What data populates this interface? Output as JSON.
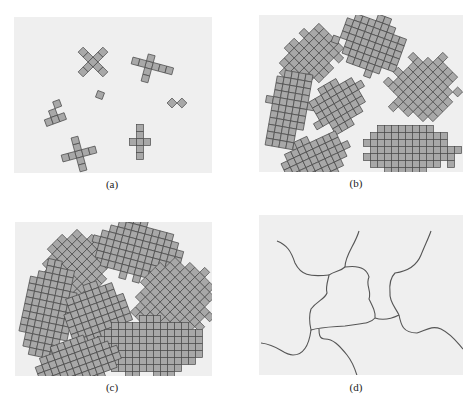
{
  "figure": {
    "colors": {
      "panel_bg": "#efefef",
      "cell_fill": "#a8a8a8",
      "cell_stroke": "#4a4a4a",
      "boundary": "#555555"
    },
    "cell_size": 7,
    "panels": [
      {
        "id": "a",
        "caption": "(a)",
        "description": "Small crystallite nuclei",
        "grains": [
          {
            "cx": 79,
            "cy": 45,
            "angle": 45,
            "cells": [
              [
                0,
                0
              ],
              [
                1,
                0
              ],
              [
                2,
                0
              ],
              [
                -1,
                0
              ],
              [
                -2,
                0
              ],
              [
                0,
                1
              ],
              [
                0,
                2
              ],
              [
                0,
                -1
              ],
              [
                0,
                -2
              ]
            ]
          },
          {
            "cx": 135,
            "cy": 48,
            "angle": 15,
            "cells": [
              [
                0,
                0
              ],
              [
                -1,
                0
              ],
              [
                -2,
                0
              ],
              [
                1,
                0
              ],
              [
                2,
                0
              ],
              [
                3,
                0
              ],
              [
                0,
                -1
              ],
              [
                0,
                1
              ],
              [
                0,
                2
              ]
            ]
          },
          {
            "cx": 158,
            "cy": 86,
            "angle": 45,
            "cells": [
              [
                0,
                0
              ],
              [
                1,
                -1
              ]
            ]
          },
          {
            "cx": 86,
            "cy": 78,
            "angle": 20,
            "cells": [
              [
                0,
                0
              ]
            ]
          },
          {
            "cx": 39,
            "cy": 96,
            "angle": -20,
            "cells": [
              [
                0,
                0
              ],
              [
                1,
                -1
              ],
              [
                -1,
                1
              ],
              [
                0,
                1
              ],
              [
                1,
                1
              ]
            ]
          },
          {
            "cx": 65,
            "cy": 137,
            "angle": -15,
            "cells": [
              [
                0,
                0
              ],
              [
                -1,
                0
              ],
              [
                -2,
                0
              ],
              [
                1,
                0
              ],
              [
                2,
                0
              ],
              [
                0,
                -1
              ],
              [
                0,
                -2
              ],
              [
                0,
                1
              ],
              [
                0,
                2
              ]
            ]
          },
          {
            "cx": 126,
            "cy": 125,
            "angle": 0,
            "cells": [
              [
                0,
                0
              ],
              [
                -1,
                0
              ],
              [
                1,
                0
              ],
              [
                0,
                -1
              ],
              [
                0,
                -2
              ],
              [
                0,
                1
              ],
              [
                0,
                2
              ]
            ]
          }
        ]
      },
      {
        "id": "b",
        "caption": "(b)",
        "description": "Growth of crystallites; grains begin to impinge"
      },
      {
        "id": "c",
        "caption": "(c)",
        "description": "Completed solidification; irregularly shaped grains"
      },
      {
        "id": "d",
        "caption": "(d)",
        "description": "Grain structure as seen under microscope; dark lines are grain boundaries"
      }
    ]
  }
}
